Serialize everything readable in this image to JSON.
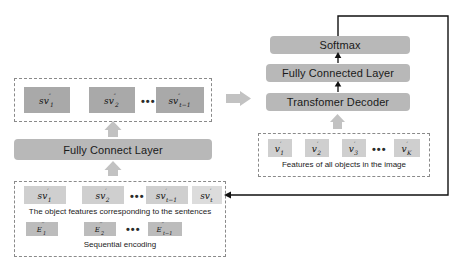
{
  "diagram": {
    "colors": {
      "block_gray": "#b8b8b8",
      "token_dark": "#a9a9a9",
      "token_mid": "#bcbcbc",
      "token_light": "#cfcfcf",
      "token_pale": "#dcdcdc",
      "dashed_border": "#8a8a8a",
      "line_black": "#111111"
    }
  },
  "left_branch": {
    "output_group": {
      "tokens": [
        {
          "base": "sv",
          "sup": "″",
          "sub": "1"
        },
        {
          "base": "sv",
          "sup": "″",
          "sub": "2"
        },
        {
          "base": "sv",
          "sup": "″",
          "sub": "t−1"
        }
      ],
      "ellipsis": "•••"
    },
    "fc_layer": {
      "label": "Fully Connect Layer"
    },
    "input_group": {
      "sentence_tokens": [
        {
          "base": "sv",
          "sup": "′",
          "sub": "1"
        },
        {
          "base": "sv",
          "sup": "′",
          "sub": "2"
        },
        {
          "base": "sv",
          "sup": "′",
          "sub": "t−1"
        },
        {
          "base": "sv",
          "sup": "′",
          "sub": "t"
        }
      ],
      "sentence_ellipsis": "•••",
      "sentence_caption": "The object features corresponding to the sentences",
      "encoding_tokens": [
        {
          "base": "E",
          "sup": "′′",
          "sub": "1"
        },
        {
          "base": "E",
          "sup": "′′",
          "sub": "2"
        },
        {
          "base": "E",
          "sup": "′′",
          "sub": "t−1"
        }
      ],
      "encoding_ellipsis": "•••",
      "encoding_caption": "Sequential encoding"
    }
  },
  "right_branch": {
    "blocks": [
      {
        "label": "Softmax"
      },
      {
        "label": "Fully Connected Layer"
      },
      {
        "label": "Transfomer Decoder"
      }
    ],
    "object_group": {
      "tokens": [
        {
          "base": "v",
          "sup": "′",
          "sub": "1"
        },
        {
          "base": "v",
          "sup": "′",
          "sub": "2"
        },
        {
          "base": "v",
          "sup": "′",
          "sub": "3"
        },
        {
          "base": "v",
          "sup": "′",
          "sub": "K"
        }
      ],
      "ellipsis": "•••",
      "caption": "Features of all objects in the image"
    }
  }
}
